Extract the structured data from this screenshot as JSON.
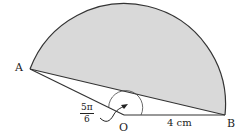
{
  "diagram": {
    "type": "circle-sector-segment",
    "points": {
      "A": {
        "label": "A"
      },
      "O": {
        "label": "O"
      },
      "B": {
        "label": "B"
      }
    },
    "radius_label": "4 cm",
    "angle_label": {
      "numerator": "5π",
      "denominator": "6"
    },
    "colors": {
      "shaded_segment": "#d9d9d9",
      "stroke": "#333333"
    }
  }
}
